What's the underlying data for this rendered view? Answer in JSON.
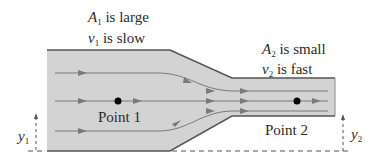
{
  "diagram": {
    "region1": {
      "area_symbol": "A",
      "area_sub": "1",
      "area_text": " is large",
      "velocity_symbol": "v",
      "velocity_sub": "1",
      "velocity_text": " is slow",
      "point_label": "Point 1",
      "height_symbol": "y",
      "height_sub": "1"
    },
    "region2": {
      "area_symbol": "A",
      "area_sub": "2",
      "area_text": " is small",
      "velocity_symbol": "v",
      "velocity_sub": "2",
      "velocity_text": " is fast",
      "point_label": "Point 2",
      "height_symbol": "y",
      "height_sub": "2"
    },
    "colors": {
      "pipe_fill": "#d3d3d3",
      "pipe_edge": "#555555",
      "streamline": "#7a7a7a",
      "text": "#2b2b2b",
      "point": "#000000"
    }
  }
}
